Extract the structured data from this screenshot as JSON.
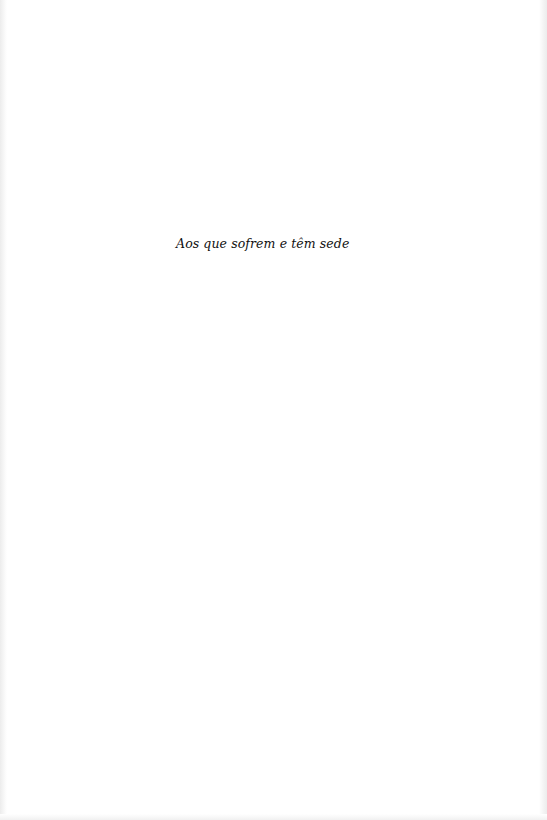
{
  "page": {
    "dedication": "Aos que sofrem e têm sede"
  }
}
